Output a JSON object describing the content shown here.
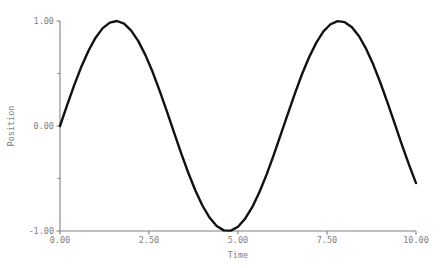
{
  "chart_data": {
    "type": "line",
    "title": "",
    "xlabel": "Time",
    "ylabel": "Position",
    "xlim": [
      0.0,
      10.0
    ],
    "ylim": [
      -1.0,
      1.0
    ],
    "grid": false,
    "legend": null,
    "line_color": "#111111",
    "axis_color": "#808080",
    "text_color": "#808080",
    "background_color": "#ffffff",
    "xticks": [
      {
        "value": 0.0,
        "label": "0.00"
      },
      {
        "value": 2.5,
        "label": "2.50"
      },
      {
        "value": 5.0,
        "label": "5.00"
      },
      {
        "value": 7.5,
        "label": "7.50"
      },
      {
        "value": 10.0,
        "label": "10.00"
      }
    ],
    "yticks": [
      {
        "value": -1.0,
        "label": "-1.00"
      },
      {
        "value": -0.5,
        "label": ""
      },
      {
        "value": 0.0,
        "label": "0.00"
      },
      {
        "value": 0.5,
        "label": ""
      },
      {
        "value": 1.0,
        "label": "1.00"
      }
    ],
    "series": [
      {
        "name": "Position",
        "function": "sin(t)",
        "x": [
          0.0,
          0.2,
          0.4,
          0.6,
          0.8,
          1.0,
          1.2,
          1.4,
          1.6,
          1.8,
          2.0,
          2.2,
          2.4,
          2.6,
          2.8,
          3.0,
          3.2,
          3.4,
          3.6,
          3.8,
          4.0,
          4.2,
          4.4,
          4.6,
          4.8,
          5.0,
          5.2,
          5.4,
          5.6,
          5.8,
          6.0,
          6.2,
          6.4,
          6.6,
          6.8,
          7.0,
          7.2,
          7.4,
          7.6,
          7.8,
          8.0,
          8.2,
          8.4,
          8.6,
          8.8,
          9.0,
          9.2,
          9.4,
          9.6,
          9.8,
          10.0
        ],
        "values": [
          0.0,
          0.199,
          0.389,
          0.565,
          0.717,
          0.841,
          0.932,
          0.985,
          1.0,
          0.974,
          0.909,
          0.808,
          0.675,
          0.516,
          0.335,
          0.141,
          -0.058,
          -0.256,
          -0.443,
          -0.612,
          -0.757,
          -0.872,
          -0.952,
          -0.994,
          -0.996,
          -0.959,
          -0.883,
          -0.773,
          -0.631,
          -0.465,
          -0.279,
          -0.083,
          0.116,
          0.311,
          0.495,
          0.657,
          0.794,
          0.901,
          0.969,
          0.999,
          0.989,
          0.941,
          0.855,
          0.734,
          0.585,
          0.412,
          0.223,
          0.024,
          -0.174,
          -0.366,
          -0.544
        ]
      }
    ]
  }
}
